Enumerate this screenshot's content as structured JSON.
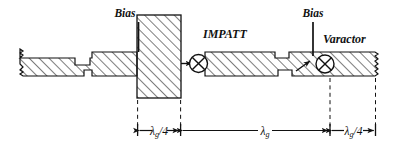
{
  "figure": {
    "type": "waveguide-circuit-diagram",
    "background_color": "#ffffff",
    "line_color": "#111111"
  },
  "labels": {
    "bias_left": "Bias",
    "bias_right": "Bias",
    "impatt": "IMPATT",
    "varactor": "Varactor"
  },
  "dimensions": [
    {
      "id": "left",
      "symbol": "λ",
      "subscript": "g",
      "suffix": "/4",
      "text": "λg/4"
    },
    {
      "id": "middle",
      "symbol": "λ",
      "subscript": "g",
      "suffix": "",
      "text": "λg"
    },
    {
      "id": "right",
      "symbol": "λ",
      "subscript": "g",
      "suffix": "/4",
      "text": "λg/4"
    }
  ],
  "components": [
    {
      "name": "impatt-diode",
      "symbol": "circle-with-x"
    },
    {
      "name": "varactor-diode",
      "symbol": "circle-with-x"
    }
  ]
}
